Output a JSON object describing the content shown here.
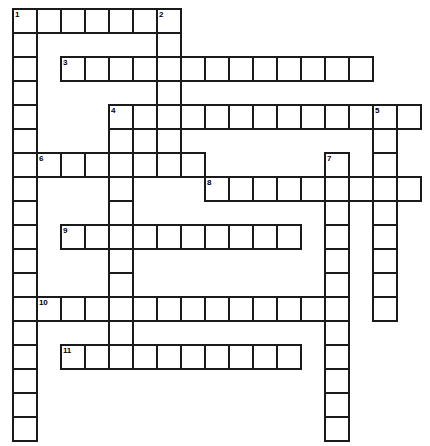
{
  "puzzle": {
    "type": "crossword-grid",
    "title": "",
    "grid": {
      "origin_x": 12,
      "origin_y": 8,
      "cell_size": 24,
      "cols": 18,
      "rows": 18,
      "background_color": "#ffffff",
      "cell_fill": "#ffffff",
      "cell_border_color": "#1a1a1a",
      "cell_border_width": 2,
      "number_color": "#000000"
    },
    "entries": [
      {
        "number": "1",
        "direction": "across",
        "col": 0,
        "row": 0,
        "length": 7
      },
      {
        "number": "1",
        "direction": "down",
        "col": 0,
        "row": 0,
        "length": 18
      },
      {
        "number": "2",
        "direction": "down",
        "col": 6,
        "row": 0,
        "length": 6
      },
      {
        "number": "3",
        "direction": "across",
        "col": 2,
        "row": 2,
        "length": 13
      },
      {
        "number": "4",
        "direction": "across",
        "col": 4,
        "row": 4,
        "length": 13
      },
      {
        "number": "4",
        "direction": "down",
        "col": 4,
        "row": 4,
        "length": 10
      },
      {
        "number": "5",
        "direction": "down",
        "col": 15,
        "row": 4,
        "length": 9
      },
      {
        "number": "6",
        "direction": "across",
        "col": 1,
        "row": 6,
        "length": 7
      },
      {
        "number": "7",
        "direction": "down",
        "col": 13,
        "row": 6,
        "length": 12
      },
      {
        "number": "8",
        "direction": "across",
        "col": 8,
        "row": 7,
        "length": 9
      },
      {
        "number": "9",
        "direction": "across",
        "col": 2,
        "row": 9,
        "length": 10
      },
      {
        "number": "10",
        "direction": "across",
        "col": 1,
        "row": 12,
        "length": 12
      },
      {
        "number": "11",
        "direction": "across",
        "col": 2,
        "row": 14,
        "length": 10
      }
    ],
    "cells": [
      {
        "col": 0,
        "row": 0,
        "number": "1"
      },
      {
        "col": 1,
        "row": 0,
        "number": ""
      },
      {
        "col": 2,
        "row": 0,
        "number": ""
      },
      {
        "col": 3,
        "row": 0,
        "number": ""
      },
      {
        "col": 4,
        "row": 0,
        "number": ""
      },
      {
        "col": 5,
        "row": 0,
        "number": ""
      },
      {
        "col": 6,
        "row": 0,
        "number": "2"
      },
      {
        "col": 0,
        "row": 1,
        "number": ""
      },
      {
        "col": 6,
        "row": 1,
        "number": ""
      },
      {
        "col": 0,
        "row": 2,
        "number": ""
      },
      {
        "col": 2,
        "row": 2,
        "number": "3"
      },
      {
        "col": 3,
        "row": 2,
        "number": ""
      },
      {
        "col": 4,
        "row": 2,
        "number": ""
      },
      {
        "col": 5,
        "row": 2,
        "number": ""
      },
      {
        "col": 6,
        "row": 2,
        "number": ""
      },
      {
        "col": 7,
        "row": 2,
        "number": ""
      },
      {
        "col": 8,
        "row": 2,
        "number": ""
      },
      {
        "col": 9,
        "row": 2,
        "number": ""
      },
      {
        "col": 10,
        "row": 2,
        "number": ""
      },
      {
        "col": 11,
        "row": 2,
        "number": ""
      },
      {
        "col": 12,
        "row": 2,
        "number": ""
      },
      {
        "col": 13,
        "row": 2,
        "number": ""
      },
      {
        "col": 14,
        "row": 2,
        "number": ""
      },
      {
        "col": 0,
        "row": 3,
        "number": ""
      },
      {
        "col": 6,
        "row": 3,
        "number": ""
      },
      {
        "col": 0,
        "row": 4,
        "number": ""
      },
      {
        "col": 4,
        "row": 4,
        "number": "4"
      },
      {
        "col": 5,
        "row": 4,
        "number": ""
      },
      {
        "col": 6,
        "row": 4,
        "number": ""
      },
      {
        "col": 7,
        "row": 4,
        "number": ""
      },
      {
        "col": 8,
        "row": 4,
        "number": ""
      },
      {
        "col": 9,
        "row": 4,
        "number": ""
      },
      {
        "col": 10,
        "row": 4,
        "number": ""
      },
      {
        "col": 11,
        "row": 4,
        "number": ""
      },
      {
        "col": 12,
        "row": 4,
        "number": ""
      },
      {
        "col": 13,
        "row": 4,
        "number": ""
      },
      {
        "col": 14,
        "row": 4,
        "number": ""
      },
      {
        "col": 15,
        "row": 4,
        "number": "5"
      },
      {
        "col": 16,
        "row": 4,
        "number": ""
      },
      {
        "col": 0,
        "row": 5,
        "number": ""
      },
      {
        "col": 4,
        "row": 5,
        "number": ""
      },
      {
        "col": 6,
        "row": 5,
        "number": ""
      },
      {
        "col": 15,
        "row": 5,
        "number": ""
      },
      {
        "col": 0,
        "row": 6,
        "number": ""
      },
      {
        "col": 1,
        "row": 6,
        "number": "6"
      },
      {
        "col": 2,
        "row": 6,
        "number": ""
      },
      {
        "col": 3,
        "row": 6,
        "number": ""
      },
      {
        "col": 4,
        "row": 6,
        "number": ""
      },
      {
        "col": 5,
        "row": 6,
        "number": ""
      },
      {
        "col": 6,
        "row": 6,
        "number": ""
      },
      {
        "col": 7,
        "row": 6,
        "number": ""
      },
      {
        "col": 13,
        "row": 6,
        "number": "7"
      },
      {
        "col": 15,
        "row": 6,
        "number": ""
      },
      {
        "col": 0,
        "row": 7,
        "number": ""
      },
      {
        "col": 4,
        "row": 7,
        "number": ""
      },
      {
        "col": 8,
        "row": 7,
        "number": "8"
      },
      {
        "col": 9,
        "row": 7,
        "number": ""
      },
      {
        "col": 10,
        "row": 7,
        "number": ""
      },
      {
        "col": 11,
        "row": 7,
        "number": ""
      },
      {
        "col": 12,
        "row": 7,
        "number": ""
      },
      {
        "col": 13,
        "row": 7,
        "number": ""
      },
      {
        "col": 14,
        "row": 7,
        "number": ""
      },
      {
        "col": 15,
        "row": 7,
        "number": ""
      },
      {
        "col": 16,
        "row": 7,
        "number": ""
      },
      {
        "col": 0,
        "row": 8,
        "number": ""
      },
      {
        "col": 4,
        "row": 8,
        "number": ""
      },
      {
        "col": 13,
        "row": 8,
        "number": ""
      },
      {
        "col": 15,
        "row": 8,
        "number": ""
      },
      {
        "col": 0,
        "row": 9,
        "number": ""
      },
      {
        "col": 2,
        "row": 9,
        "number": "9"
      },
      {
        "col": 3,
        "row": 9,
        "number": ""
      },
      {
        "col": 4,
        "row": 9,
        "number": ""
      },
      {
        "col": 5,
        "row": 9,
        "number": ""
      },
      {
        "col": 6,
        "row": 9,
        "number": ""
      },
      {
        "col": 7,
        "row": 9,
        "number": ""
      },
      {
        "col": 8,
        "row": 9,
        "number": ""
      },
      {
        "col": 9,
        "row": 9,
        "number": ""
      },
      {
        "col": 10,
        "row": 9,
        "number": ""
      },
      {
        "col": 11,
        "row": 9,
        "number": ""
      },
      {
        "col": 13,
        "row": 9,
        "number": ""
      },
      {
        "col": 15,
        "row": 9,
        "number": ""
      },
      {
        "col": 0,
        "row": 10,
        "number": ""
      },
      {
        "col": 4,
        "row": 10,
        "number": ""
      },
      {
        "col": 13,
        "row": 10,
        "number": ""
      },
      {
        "col": 15,
        "row": 10,
        "number": ""
      },
      {
        "col": 0,
        "row": 11,
        "number": ""
      },
      {
        "col": 4,
        "row": 11,
        "number": ""
      },
      {
        "col": 13,
        "row": 11,
        "number": ""
      },
      {
        "col": 15,
        "row": 11,
        "number": ""
      },
      {
        "col": 0,
        "row": 12,
        "number": ""
      },
      {
        "col": 1,
        "row": 12,
        "number": "10"
      },
      {
        "col": 2,
        "row": 12,
        "number": ""
      },
      {
        "col": 3,
        "row": 12,
        "number": ""
      },
      {
        "col": 4,
        "row": 12,
        "number": ""
      },
      {
        "col": 5,
        "row": 12,
        "number": ""
      },
      {
        "col": 6,
        "row": 12,
        "number": ""
      },
      {
        "col": 7,
        "row": 12,
        "number": ""
      },
      {
        "col": 8,
        "row": 12,
        "number": ""
      },
      {
        "col": 9,
        "row": 12,
        "number": ""
      },
      {
        "col": 10,
        "row": 12,
        "number": ""
      },
      {
        "col": 11,
        "row": 12,
        "number": ""
      },
      {
        "col": 12,
        "row": 12,
        "number": ""
      },
      {
        "col": 13,
        "row": 12,
        "number": ""
      },
      {
        "col": 15,
        "row": 12,
        "number": ""
      },
      {
        "col": 0,
        "row": 13,
        "number": ""
      },
      {
        "col": 4,
        "row": 13,
        "number": ""
      },
      {
        "col": 13,
        "row": 13,
        "number": ""
      },
      {
        "col": 0,
        "row": 14,
        "number": ""
      },
      {
        "col": 2,
        "row": 14,
        "number": "11"
      },
      {
        "col": 3,
        "row": 14,
        "number": ""
      },
      {
        "col": 4,
        "row": 14,
        "number": ""
      },
      {
        "col": 5,
        "row": 14,
        "number": ""
      },
      {
        "col": 6,
        "row": 14,
        "number": ""
      },
      {
        "col": 7,
        "row": 14,
        "number": ""
      },
      {
        "col": 8,
        "row": 14,
        "number": ""
      },
      {
        "col": 9,
        "row": 14,
        "number": ""
      },
      {
        "col": 10,
        "row": 14,
        "number": ""
      },
      {
        "col": 11,
        "row": 14,
        "number": ""
      },
      {
        "col": 13,
        "row": 14,
        "number": ""
      },
      {
        "col": 0,
        "row": 15,
        "number": ""
      },
      {
        "col": 13,
        "row": 15,
        "number": ""
      },
      {
        "col": 0,
        "row": 16,
        "number": ""
      },
      {
        "col": 13,
        "row": 16,
        "number": ""
      },
      {
        "col": 0,
        "row": 17,
        "number": ""
      },
      {
        "col": 13,
        "row": 17,
        "number": ""
      }
    ]
  }
}
